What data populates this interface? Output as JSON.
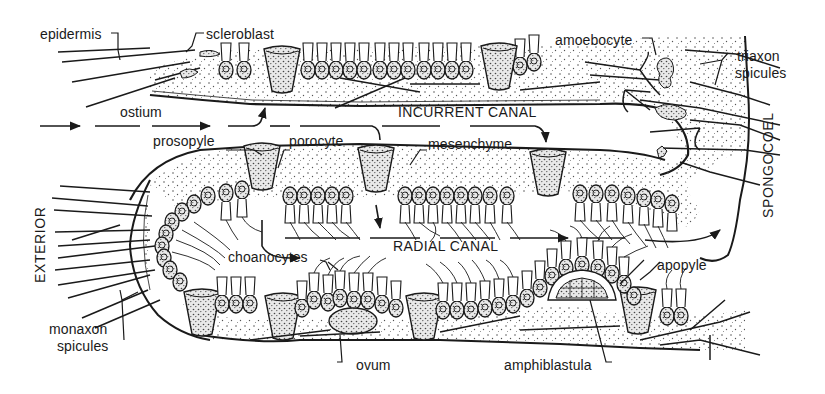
{
  "figure": {
    "type": "anatomical cross-section illustration",
    "colors": {
      "ink": "#1a1a1a",
      "background": "#ffffff",
      "stipple": "#555555"
    }
  },
  "labels": {
    "epidermis": "epidermis",
    "scleroblast": "scleroblast",
    "amoebocyte": "amoebocyte",
    "triaxon_spicules_1": "triaxon",
    "triaxon_spicules_2": "spicules",
    "ostium": "ostium",
    "incurrent_canal": "INCURRENT CANAL",
    "prosopyle": "prosopyle",
    "porocyte": "porocyte",
    "mesenchyme": "mesenchyme",
    "spongocoel": "SPONGOCOEL",
    "exterior": "EXTERIOR",
    "choanocytes": "choanocytes",
    "radial_canal": "RADIAL CANAL",
    "apopyle": "apopyle",
    "monaxon_spicules_1": "monaxon",
    "monaxon_spicules_2": "spicules",
    "ovum": "ovum",
    "amphiblastula": "amphiblastula"
  }
}
